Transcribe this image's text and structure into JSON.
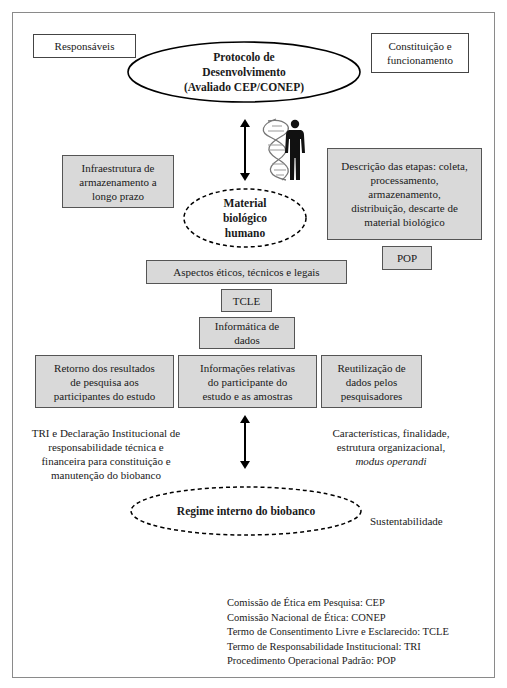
{
  "diagram": {
    "top_left_box": "Responsáveis",
    "top_right_box": "Constituição e funcionamento",
    "protocol_ellipse": {
      "line1": "Protocolo de",
      "line2": "Desenvolvimento",
      "line3": "(Avaliado CEP/CONEP)"
    },
    "icons": {
      "dna": "dna-helix-icon",
      "person": "human-silhouette-icon",
      "arrow": "double-headed-vertical-arrow-icon"
    },
    "infrastructure_box": "Infraestrutura de armazenamento a longo prazo",
    "material_ellipse": {
      "line1": "Material",
      "line2": "biológico",
      "line3": "humano"
    },
    "steps_box": "Descrição das etapas: coleta, processamento, armazenamento, distribuição, descarte de material biológico",
    "pop_box": "POP",
    "aspects_box": "Aspectos éticos, técnicos e legais",
    "tcle_box": "TCLE",
    "informatics_box": "Informática de dados",
    "row_boxes": [
      "Retorno dos resultados de pesquisa aos participantes do estudo",
      "Informações relativas do participante do estudo e as amostras",
      "Reutilização de dados pelos pesquisadores"
    ],
    "left_text": "TRI e Declaração Institucional de responsabilidade técnica e financeira para constituição e manutenção do biobanco",
    "right_text": {
      "line1": "Características, finalidade,",
      "line2": "estrutura organizacional,",
      "line3": "modus operandi"
    },
    "regime_ellipse": "Regime interno do biobanco",
    "sustainability_label": "Sustentabilidade",
    "legend": [
      "Comissão de Ética em Pesquisa: CEP",
      "Comissão Nacional de Ética: CONEP",
      "Termo de Consentimento Livre e Esclarecido: TCLE",
      "Termo de Responsabilidade Institucional: TRI",
      "Procedimento Operacional Padrão: POP"
    ]
  },
  "colors": {
    "gray_box_fill": "#d9d9d9",
    "border": "#444444",
    "frame_border": "#8a8a8a",
    "text": "#1a1a1a"
  }
}
